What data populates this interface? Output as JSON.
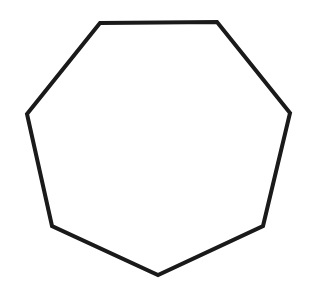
{
  "diagram": {
    "shape": "heptagon",
    "sides": 7,
    "background_color": "#ffffff",
    "stroke_color": "#1a1a1a",
    "fill_color": "none",
    "stroke_width": 4,
    "vertices": [
      [
        100,
        23
      ],
      [
        217,
        22
      ],
      [
        290,
        113
      ],
      [
        263,
        226
      ],
      [
        158,
        275
      ],
      [
        52,
        226
      ],
      [
        27,
        114
      ]
    ]
  }
}
